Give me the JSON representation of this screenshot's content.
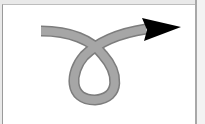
{
  "figure": {
    "colors": {
      "background": "#ffffff",
      "stroke": "#a6a6a6",
      "stroke_edge": "#7a7a7a",
      "arrowhead": "#000000",
      "frame_border": "#9a9a9a"
    },
    "stroke_width": 9
  }
}
